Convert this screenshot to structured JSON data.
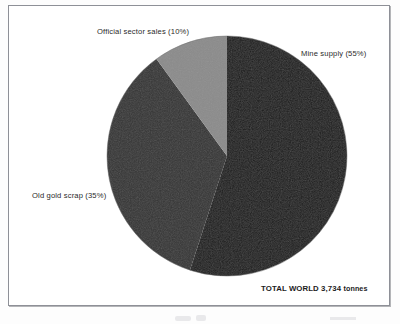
{
  "figure": {
    "total_note_value": "TOTAL WORLD 3,734",
    "total_note_unit": "tonnes"
  },
  "chart_data": {
    "type": "pie",
    "title": "",
    "subtitle": "",
    "categories": [
      "Mine supply",
      "Old gold scrap",
      "Official sector sales"
    ],
    "values": [
      55,
      35,
      10
    ],
    "value_unit": "%",
    "total_label": "TOTAL WORLD 3,734 tonnes",
    "total_value": 3734,
    "total_unit": "tonnes",
    "legend": "none",
    "grid": false,
    "start_angle_deg": 0,
    "direction": "clockwise",
    "slices": [
      {
        "name": "Mine supply",
        "label": "Mine supply (55%)",
        "percent": 55,
        "tonnes": 2054,
        "color": "#1b1b1b",
        "label_position": "right"
      },
      {
        "name": "Old gold scrap",
        "label": "Old gold scrap (35%)",
        "percent": 35,
        "tonnes": 1307,
        "color": "#343434",
        "label_position": "left"
      },
      {
        "name": "Official sector sales",
        "label": "Official sector sales (10%)",
        "percent": 10,
        "tonnes": 373,
        "color": "#8b8b8b",
        "label_position": "top-left"
      }
    ]
  }
}
